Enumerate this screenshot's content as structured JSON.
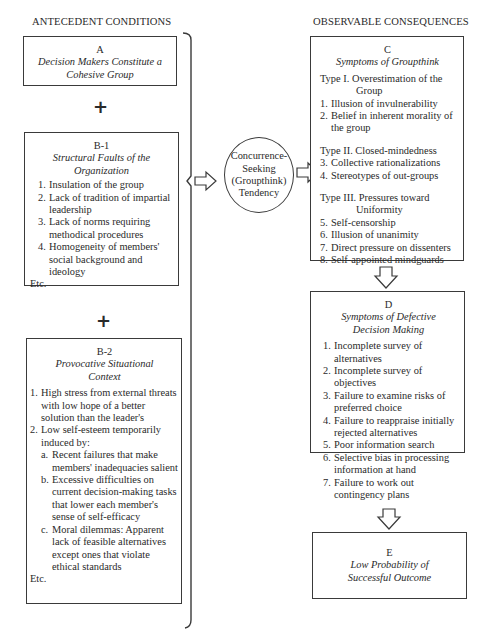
{
  "headers": {
    "left": "ANTECEDENT CONDITIONS",
    "right": "OBSERVABLE CONSEQUENCES"
  },
  "plus_symbol": "+",
  "box_a": {
    "letter": "A",
    "title": "Decision Makers Constitute a Cohesive Group"
  },
  "box_b1": {
    "letter": "B-1",
    "title_line1": "Structural Faults of the",
    "title_line2": "Organization",
    "items": [
      {
        "num": "1.",
        "text": "Insulation of the group"
      },
      {
        "num": "2.",
        "text": "Lack of tradition of impartial leadership"
      },
      {
        "num": "3.",
        "text": "Lack of norms requiring methodical procedures"
      },
      {
        "num": "4.",
        "text": "Homogeneity of members' social background and ideology"
      }
    ],
    "etc": "Etc."
  },
  "box_b2": {
    "letter": "B-2",
    "title_line1": "Provocative Situational",
    "title_line2": "Context",
    "items": [
      {
        "num": "1.",
        "text": "High stress from external threats with low hope of a better solution than the leader's"
      },
      {
        "num": "2.",
        "text": "Low self-esteem temporarily induced by:"
      }
    ],
    "subitems": [
      {
        "num": "a.",
        "text": "Recent failures that make members' inadequacies salient"
      },
      {
        "num": "b.",
        "text": "Excessive difficulties on current decision-making tasks that lower each member's sense of self-efficacy"
      },
      {
        "num": "c.",
        "text": "Moral dilemmas: Apparent lack of feasible alternatives except ones that violate ethical standards"
      }
    ],
    "etc": "Etc."
  },
  "circle": {
    "line1": "Concurrence-",
    "line2": "Seeking",
    "line3": "(Groupthink)",
    "line4": "Tendency"
  },
  "box_c": {
    "letter": "C",
    "title": "Symptoms of Groupthink",
    "types": [
      {
        "label": "Type I. Overestimation of the",
        "cont": "Group",
        "items": [
          {
            "num": "1.",
            "text": "Illusion of invulnerability"
          },
          {
            "num": "2.",
            "text": "Belief in inherent morality of the group"
          }
        ]
      },
      {
        "label": "Type II. Closed-mindedness",
        "cont": "",
        "items": [
          {
            "num": "3.",
            "text": "Collective rationalizations"
          },
          {
            "num": "4.",
            "text": "Stereotypes of out-groups"
          }
        ]
      },
      {
        "label": "Type III. Pressures toward",
        "cont": "Uniformity",
        "items": [
          {
            "num": "5.",
            "text": "Self-censorship"
          },
          {
            "num": "6.",
            "text": "Illusion of unanimity"
          },
          {
            "num": "7.",
            "text": "Direct pressure on dissenters"
          },
          {
            "num": "8.",
            "text": "Self-appointed mindguards"
          }
        ]
      }
    ]
  },
  "box_d": {
    "letter": "D",
    "title_line1": "Symptoms of Defective",
    "title_line2": "Decision Making",
    "items": [
      {
        "num": "1.",
        "text": "Incomplete survey of alternatives"
      },
      {
        "num": "2.",
        "text": "Incomplete survey of objectives"
      },
      {
        "num": "3.",
        "text": "Failure to examine risks of preferred choice"
      },
      {
        "num": "4.",
        "text": "Failure to reappraise initially rejected alternatives"
      },
      {
        "num": "5.",
        "text": "Poor information search"
      },
      {
        "num": "6.",
        "text": "Selective bias in processing information at hand"
      },
      {
        "num": "7.",
        "text": "Failure to work out contingency plans"
      }
    ]
  },
  "box_e": {
    "letter": "E",
    "title_line1": "Low Probability of",
    "title_line2": "Successful Outcome"
  }
}
